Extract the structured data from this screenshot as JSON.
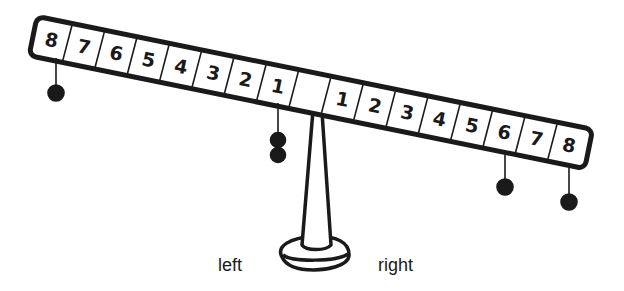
{
  "diagram": {
    "type": "balance-scale",
    "beam": {
      "left_labels": [
        "8",
        "7",
        "6",
        "5",
        "4",
        "3",
        "2",
        "1"
      ],
      "right_labels": [
        "1",
        "2",
        "3",
        "4",
        "5",
        "6",
        "7",
        "8"
      ],
      "tilt": "left side up, right side down"
    },
    "weights": {
      "left": [
        {
          "position": 8,
          "count": 1
        },
        {
          "position": 1,
          "count": 2
        }
      ],
      "right": [
        {
          "position": 6,
          "count": 1
        },
        {
          "position": 8,
          "count": 1
        }
      ]
    },
    "labels": {
      "left": "left",
      "right": "right"
    },
    "colors": {
      "ink": "#1a1a1a",
      "background": "#ffffff"
    }
  }
}
